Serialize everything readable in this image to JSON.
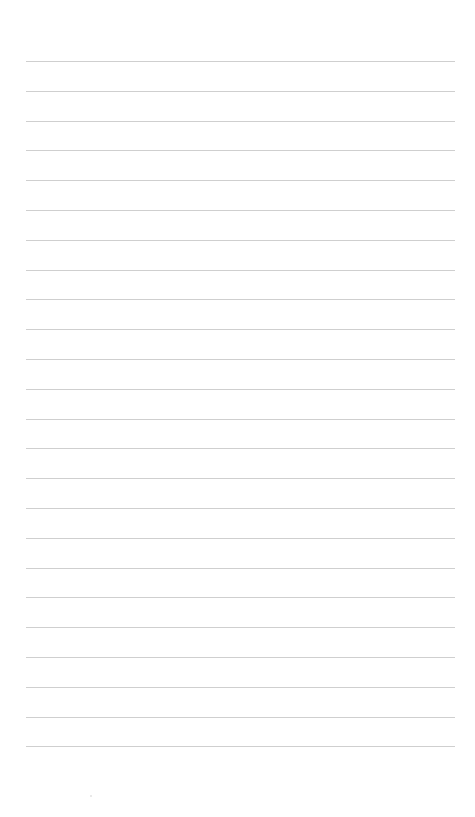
{
  "document": {
    "type": "blank lined paper",
    "line_count": 24,
    "first_line_y": 61,
    "line_spacing": 29.8,
    "line_left": 26,
    "line_right": 455,
    "line_color": "#cfcfcf",
    "background_color": "#ffffff"
  }
}
